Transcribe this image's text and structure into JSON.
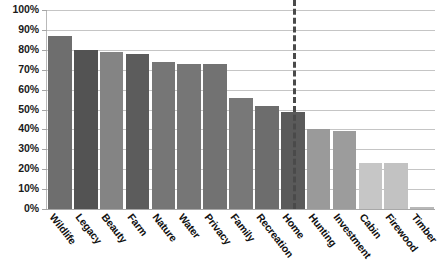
{
  "chart_data": {
    "type": "bar",
    "title": "",
    "subtitle": "",
    "xlabel": "",
    "ylabel": "",
    "ylim": [
      0,
      100
    ],
    "grid": true,
    "legend": false,
    "categories": [
      "Wildlife",
      "Legacy",
      "Beauty",
      "Farm",
      "Nature",
      "Water",
      "Privacy",
      "Family",
      "Recreation",
      "Home",
      "Hunting",
      "Investment",
      "Cabin",
      "Firewood",
      "Timber"
    ],
    "values": [
      87,
      80,
      79,
      78,
      74,
      73,
      73,
      56,
      52,
      49,
      40,
      39,
      23,
      23,
      1
    ],
    "value_labels": [
      "87%",
      "80%",
      "79%",
      "78%",
      "74%",
      "73%",
      "73%",
      "56%",
      "52%",
      "49%",
      "40%",
      "39%",
      "23%",
      "23%",
      "1%"
    ],
    "bar_colors": [
      "#6e6e6e",
      "#535353",
      "#848484",
      "#5c5c5c",
      "#767676",
      "#767676",
      "#727272",
      "#787878",
      "#6d6d6d",
      "#5a5a5a",
      "#9a9a9a",
      "#9c9c9c",
      "#c6c6c6",
      "#c2c2c2",
      "#b8b8b8"
    ],
    "ytick_labels": [
      "100%",
      "90%",
      "80%",
      "70%",
      "60%",
      "50%",
      "40%",
      "30%",
      "20%",
      "10%",
      "0%"
    ],
    "ytick_values": [
      100,
      90,
      80,
      70,
      60,
      50,
      40,
      30,
      20,
      10,
      0
    ],
    "annotations": [
      {
        "name": "section-divider",
        "type": "vertical-dashed-line",
        "after_category": "Recreation",
        "position_value": 9.5,
        "color": "#4a4a4a"
      }
    ],
    "colors": {
      "gridline": "#c5c5c5",
      "axis": "#b9b9b9",
      "text": "#111111",
      "background": "#ffffff",
      "divider": "#4a4a4a"
    }
  }
}
